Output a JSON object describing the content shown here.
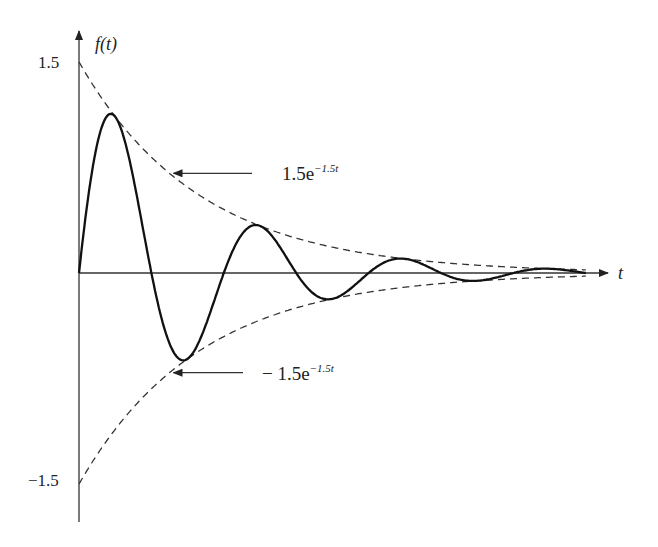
{
  "chart_data": {
    "type": "line",
    "title": "",
    "xlabel": "t",
    "ylabel": "f(t)",
    "xlim": [
      0,
      2.8
    ],
    "ylim": [
      -1.5,
      1.5
    ],
    "y_tick_labels": [
      "1.5",
      "−1.5"
    ],
    "y_ticks": [
      1.5,
      -1.5
    ],
    "grid": false,
    "series": [
      {
        "name": "f(t) = 1.5e^{-1.5t} sin(2.5πt)",
        "style": "solid",
        "amplitude": 1.5,
        "decay": 1.5,
        "omega_over_pi": 2.5
      },
      {
        "name": "upper envelope",
        "style": "dashed",
        "amplitude": 1.5,
        "decay": 1.5
      },
      {
        "name": "lower envelope",
        "style": "dashed",
        "amplitude": -1.5,
        "decay": 1.5
      }
    ],
    "annotations": [
      {
        "text_main": "1.5e",
        "text_exp": "−1.5t",
        "points_to": "upper envelope",
        "at_t": 0.5
      },
      {
        "text_main": "− 1.5e",
        "text_exp": "−1.5t",
        "points_to": "lower envelope",
        "at_t": 0.5
      }
    ]
  }
}
